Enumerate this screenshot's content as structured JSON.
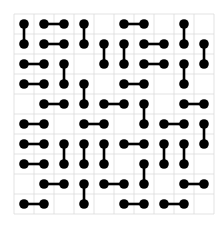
{
  "puzzle": {
    "name": "domino-tiling-grid",
    "rows": 10,
    "cols": 10,
    "colors": {
      "background": "#ffffff",
      "grid_line": "#dcdcdc",
      "domino": "#000000"
    },
    "dominoes": [
      {
        "a": [
          0,
          0
        ],
        "b": [
          1,
          0
        ]
      },
      {
        "a": [
          0,
          1
        ],
        "b": [
          0,
          2
        ]
      },
      {
        "a": [
          0,
          3
        ],
        "b": [
          1,
          3
        ]
      },
      {
        "a": [
          0,
          5
        ],
        "b": [
          0,
          6
        ]
      },
      {
        "a": [
          0,
          8
        ],
        "b": [
          1,
          8
        ]
      },
      {
        "a": [
          1,
          1
        ],
        "b": [
          1,
          2
        ]
      },
      {
        "a": [
          1,
          4
        ],
        "b": [
          2,
          4
        ]
      },
      {
        "a": [
          1,
          5
        ],
        "b": [
          2,
          5
        ]
      },
      {
        "a": [
          1,
          6
        ],
        "b": [
          1,
          7
        ]
      },
      {
        "a": [
          1,
          9
        ],
        "b": [
          2,
          9
        ]
      },
      {
        "a": [
          2,
          0
        ],
        "b": [
          2,
          1
        ]
      },
      {
        "a": [
          2,
          2
        ],
        "b": [
          3,
          2
        ]
      },
      {
        "a": [
          2,
          6
        ],
        "b": [
          2,
          7
        ]
      },
      {
        "a": [
          2,
          8
        ],
        "b": [
          3,
          8
        ]
      },
      {
        "a": [
          3,
          0
        ],
        "b": [
          3,
          1
        ]
      },
      {
        "a": [
          3,
          3
        ],
        "b": [
          4,
          3
        ]
      },
      {
        "a": [
          3,
          5
        ],
        "b": [
          3,
          6
        ]
      },
      {
        "a": [
          4,
          1
        ],
        "b": [
          4,
          2
        ]
      },
      {
        "a": [
          4,
          4
        ],
        "b": [
          4,
          5
        ]
      },
      {
        "a": [
          4,
          6
        ],
        "b": [
          5,
          6
        ]
      },
      {
        "a": [
          4,
          8
        ],
        "b": [
          4,
          9
        ]
      },
      {
        "a": [
          5,
          0
        ],
        "b": [
          5,
          1
        ]
      },
      {
        "a": [
          5,
          3
        ],
        "b": [
          5,
          4
        ]
      },
      {
        "a": [
          5,
          7
        ],
        "b": [
          5,
          8
        ]
      },
      {
        "a": [
          5,
          9
        ],
        "b": [
          6,
          9
        ]
      },
      {
        "a": [
          6,
          0
        ],
        "b": [
          6,
          1
        ]
      },
      {
        "a": [
          6,
          2
        ],
        "b": [
          7,
          2
        ]
      },
      {
        "a": [
          6,
          3
        ],
        "b": [
          7,
          3
        ]
      },
      {
        "a": [
          6,
          4
        ],
        "b": [
          7,
          4
        ]
      },
      {
        "a": [
          6,
          5
        ],
        "b": [
          6,
          6
        ]
      },
      {
        "a": [
          6,
          7
        ],
        "b": [
          7,
          7
        ]
      },
      {
        "a": [
          6,
          8
        ],
        "b": [
          7,
          8
        ]
      },
      {
        "a": [
          7,
          0
        ],
        "b": [
          7,
          1
        ]
      },
      {
        "a": [
          7,
          6
        ],
        "b": [
          8,
          6
        ]
      },
      {
        "a": [
          8,
          1
        ],
        "b": [
          8,
          2
        ]
      },
      {
        "a": [
          8,
          3
        ],
        "b": [
          9,
          3
        ]
      },
      {
        "a": [
          8,
          4
        ],
        "b": [
          8,
          5
        ]
      },
      {
        "a": [
          8,
          8
        ],
        "b": [
          8,
          9
        ]
      },
      {
        "a": [
          9,
          0
        ],
        "b": [
          9,
          1
        ]
      },
      {
        "a": [
          9,
          5
        ],
        "b": [
          9,
          6
        ]
      },
      {
        "a": [
          9,
          7
        ],
        "b": [
          9,
          8
        ]
      }
    ]
  }
}
